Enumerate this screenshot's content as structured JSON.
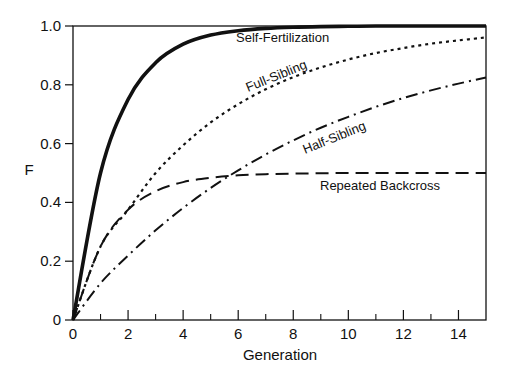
{
  "chart_data": {
    "type": "line",
    "title": "",
    "xlabel": "Generation",
    "ylabel": "F",
    "xlim": [
      0,
      15
    ],
    "ylim": [
      0,
      1.0
    ],
    "x_ticks": [
      0,
      2,
      4,
      6,
      8,
      10,
      12,
      14
    ],
    "x_tick_labels": [
      "0",
      "2",
      "4",
      "6",
      "8",
      "10",
      "12",
      "14"
    ],
    "x_minor_ticks": [
      1,
      3,
      5,
      7,
      9,
      11,
      13
    ],
    "y_ticks": [
      0,
      0.2,
      0.4,
      0.6,
      0.8,
      1.0
    ],
    "y_tick_labels": [
      "0",
      "0.2",
      "0.4",
      "0.6",
      "0.8",
      "1.0"
    ],
    "grid": false,
    "legend": "inline labels",
    "x": [
      0,
      1,
      2,
      3,
      4,
      5,
      6,
      7,
      8,
      9,
      10,
      11,
      12,
      13,
      14,
      15
    ],
    "series": [
      {
        "name": "Self-Fertilization",
        "style": "solid-thick",
        "values": [
          0,
          0.5,
          0.75,
          0.875,
          0.938,
          0.969,
          0.984,
          0.992,
          0.996,
          0.998,
          0.999,
          1.0,
          1.0,
          1.0,
          1.0,
          1.0
        ]
      },
      {
        "name": "Full-Sibling",
        "style": "dotted",
        "values": [
          0,
          0.25,
          0.375,
          0.5,
          0.594,
          0.672,
          0.734,
          0.785,
          0.826,
          0.859,
          0.886,
          0.908,
          0.925,
          0.94,
          0.951,
          0.961
        ]
      },
      {
        "name": "Half-Sibling",
        "style": "dash-dot",
        "values": [
          0,
          0.125,
          0.219,
          0.305,
          0.381,
          0.449,
          0.509,
          0.563,
          0.611,
          0.654,
          0.691,
          0.725,
          0.755,
          0.781,
          0.804,
          0.825
        ]
      },
      {
        "name": "Repeated Backcross",
        "style": "dashed",
        "values": [
          0,
          0.25,
          0.375,
          0.438,
          0.469,
          0.484,
          0.492,
          0.496,
          0.498,
          0.499,
          0.5,
          0.5,
          0.5,
          0.5,
          0.5,
          0.5
        ]
      }
    ],
    "annotations": [
      {
        "text": "Self-Fertilization",
        "series": "Self-Fertilization"
      },
      {
        "text": "Full-Sibling",
        "series": "Full-Sibling"
      },
      {
        "text": "Half-Sibling",
        "series": "Half-Sibling"
      },
      {
        "text": "Repeated Backcross",
        "series": "Repeated Backcross"
      }
    ]
  }
}
